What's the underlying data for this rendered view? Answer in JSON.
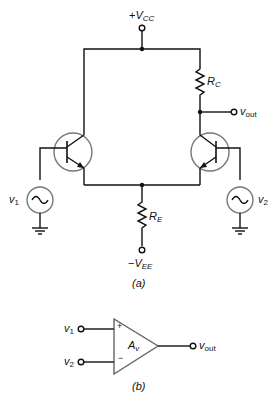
{
  "figure_a": {
    "caption": "(a)",
    "vcc": {
      "sign": "+",
      "symbol": "V",
      "sub": "CC"
    },
    "vee": {
      "sign": "−",
      "symbol": "V",
      "sub": "EE"
    },
    "rc": {
      "symbol": "R",
      "sub": "C"
    },
    "re": {
      "symbol": "R",
      "sub": "E"
    },
    "vout": {
      "symbol": "v",
      "sub": "out"
    },
    "v1": {
      "symbol": "v",
      "sub": "1"
    },
    "v2": {
      "symbol": "v",
      "sub": "2"
    }
  },
  "figure_b": {
    "caption": "(b)",
    "gain": {
      "symbol": "A",
      "sub": "v"
    },
    "plus": "+",
    "minus": "−",
    "v1": {
      "symbol": "v",
      "sub": "1"
    },
    "v2": {
      "symbol": "v",
      "sub": "2"
    },
    "vout": {
      "symbol": "v",
      "sub": "out"
    }
  }
}
